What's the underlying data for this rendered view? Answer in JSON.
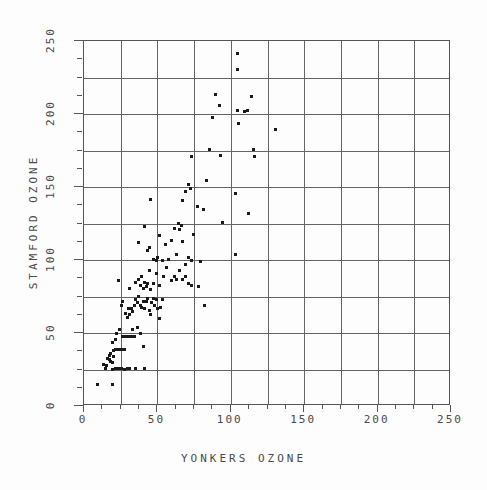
{
  "chart_data": {
    "type": "scatter",
    "title": "",
    "xlabel": "YONKERS OZONE",
    "ylabel": "STAMFORD OZONE",
    "xlim": [
      0,
      250
    ],
    "ylim": [
      0,
      250
    ],
    "xticks": [
      0,
      50,
      100,
      150,
      200,
      250
    ],
    "yticks": [
      0,
      50,
      100,
      150,
      200,
      250
    ],
    "xticklabels": [
      "0",
      "50",
      "100",
      "150",
      "200",
      "250"
    ],
    "yticklabels": [
      "0",
      "50",
      "100",
      "150",
      "200",
      "250"
    ],
    "grid": true,
    "grid_spacing": 25,
    "minor_tick_spacing": 12.5,
    "legend": null,
    "marker": "square",
    "marker_color": "#1a1a1a",
    "marker_size": 3,
    "n_points": 136,
    "points": [
      [
        10,
        14
      ],
      [
        20,
        14
      ],
      [
        15,
        25
      ],
      [
        14,
        28
      ],
      [
        16,
        27
      ],
      [
        17,
        32
      ],
      [
        18,
        34
      ],
      [
        18,
        31
      ],
      [
        19,
        30
      ],
      [
        19,
        35
      ],
      [
        20,
        29
      ],
      [
        20,
        24
      ],
      [
        21,
        33
      ],
      [
        21,
        37
      ],
      [
        22,
        38
      ],
      [
        23,
        38
      ],
      [
        24,
        38
      ],
      [
        25,
        38
      ],
      [
        26,
        38
      ],
      [
        27,
        38
      ],
      [
        28,
        38
      ],
      [
        22,
        25
      ],
      [
        24,
        25
      ],
      [
        26,
        25
      ],
      [
        28,
        24
      ],
      [
        30,
        25
      ],
      [
        32,
        25
      ],
      [
        36,
        25
      ],
      [
        42,
        25
      ],
      [
        20,
        43
      ],
      [
        22,
        45
      ],
      [
        23,
        49
      ],
      [
        25,
        52
      ],
      [
        27,
        47
      ],
      [
        29,
        47
      ],
      [
        31,
        47
      ],
      [
        33,
        47
      ],
      [
        34,
        52
      ],
      [
        35,
        47
      ],
      [
        37,
        53
      ],
      [
        39,
        49
      ],
      [
        41,
        40
      ],
      [
        26,
        68
      ],
      [
        27,
        71
      ],
      [
        29,
        63
      ],
      [
        30,
        60
      ],
      [
        31,
        66
      ],
      [
        32,
        62
      ],
      [
        33,
        66
      ],
      [
        34,
        64
      ],
      [
        35,
        68
      ],
      [
        36,
        72
      ],
      [
        37,
        70
      ],
      [
        38,
        74
      ],
      [
        39,
        68
      ],
      [
        40,
        67
      ],
      [
        41,
        71
      ],
      [
        42,
        66
      ],
      [
        43,
        71
      ],
      [
        44,
        73
      ],
      [
        45,
        65
      ],
      [
        46,
        62
      ],
      [
        47,
        70
      ],
      [
        48,
        73
      ],
      [
        49,
        68
      ],
      [
        50,
        72
      ],
      [
        51,
        66
      ],
      [
        52,
        59
      ],
      [
        53,
        67
      ],
      [
        54,
        72
      ],
      [
        24,
        85
      ],
      [
        32,
        80
      ],
      [
        36,
        84
      ],
      [
        38,
        86
      ],
      [
        39,
        82
      ],
      [
        40,
        88
      ],
      [
        41,
        80
      ],
      [
        42,
        84
      ],
      [
        43,
        81
      ],
      [
        44,
        83
      ],
      [
        45,
        92
      ],
      [
        46,
        79
      ],
      [
        48,
        83
      ],
      [
        50,
        90
      ],
      [
        52,
        82
      ],
      [
        55,
        88
      ],
      [
        57,
        94
      ],
      [
        60,
        85
      ],
      [
        62,
        88
      ],
      [
        64,
        86
      ],
      [
        66,
        92
      ],
      [
        68,
        86
      ],
      [
        70,
        88
      ],
      [
        72,
        83
      ],
      [
        74,
        82
      ],
      [
        79,
        81
      ],
      [
        38,
        111
      ],
      [
        42,
        122
      ],
      [
        44,
        106
      ],
      [
        45,
        108
      ],
      [
        46,
        141
      ],
      [
        48,
        100
      ],
      [
        50,
        99
      ],
      [
        51,
        101
      ],
      [
        52,
        116
      ],
      [
        54,
        99
      ],
      [
        56,
        110
      ],
      [
        58,
        100
      ],
      [
        60,
        113
      ],
      [
        62,
        121
      ],
      [
        64,
        103
      ],
      [
        65,
        124
      ],
      [
        66,
        120
      ],
      [
        67,
        123
      ],
      [
        68,
        112
      ],
      [
        70,
        96
      ],
      [
        72,
        101
      ],
      [
        74,
        99
      ],
      [
        75,
        117
      ],
      [
        80,
        98
      ],
      [
        83,
        68
      ],
      [
        68,
        140
      ],
      [
        70,
        146
      ],
      [
        72,
        151
      ],
      [
        73,
        148
      ],
      [
        74,
        170
      ],
      [
        78,
        136
      ],
      [
        82,
        134
      ],
      [
        84,
        154
      ],
      [
        86,
        175
      ],
      [
        88,
        197
      ],
      [
        90,
        213
      ],
      [
        93,
        205
      ],
      [
        94,
        171
      ],
      [
        95,
        125
      ],
      [
        104,
        145
      ],
      [
        104,
        103
      ],
      [
        105,
        241
      ],
      [
        105,
        230
      ],
      [
        105,
        202
      ],
      [
        106,
        193
      ],
      [
        110,
        201
      ],
      [
        112,
        202
      ],
      [
        113,
        131
      ],
      [
        115,
        211
      ],
      [
        116,
        175
      ],
      [
        117,
        170
      ],
      [
        131,
        189
      ]
    ]
  },
  "axes": {
    "x_axis_name": "x-axis",
    "y_axis_name": "y-axis"
  }
}
